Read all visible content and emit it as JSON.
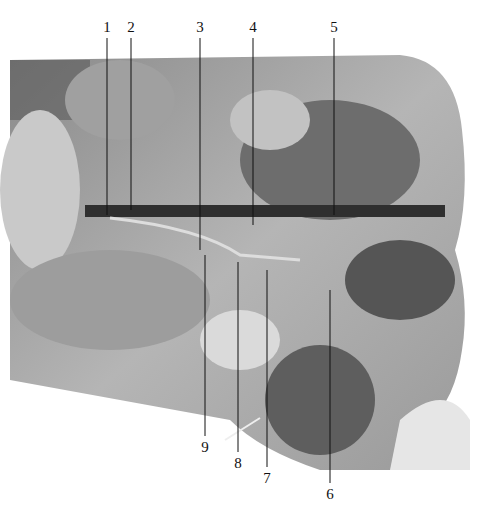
{
  "figure": {
    "type": "anatomical dissection photograph (grayscale)",
    "labels_top": [
      {
        "text": "1",
        "x": 107,
        "y": 20,
        "line_to": 215
      },
      {
        "text": "2",
        "x": 131,
        "y": 20,
        "line_to": 210
      },
      {
        "text": "3",
        "x": 200,
        "y": 20,
        "line_to": 250
      },
      {
        "text": "4",
        "x": 253,
        "y": 20,
        "line_to": 225
      },
      {
        "text": "5",
        "x": 334,
        "y": 20,
        "line_to": 215
      }
    ],
    "labels_bottom": [
      {
        "text": "9",
        "x": 205,
        "y": 440,
        "line_from": 255
      },
      {
        "text": "8",
        "x": 238,
        "y": 456,
        "line_from": 262
      },
      {
        "text": "7",
        "x": 267,
        "y": 471,
        "line_from": 270
      },
      {
        "text": "6",
        "x": 330,
        "y": 487,
        "line_from": 290
      }
    ]
  }
}
